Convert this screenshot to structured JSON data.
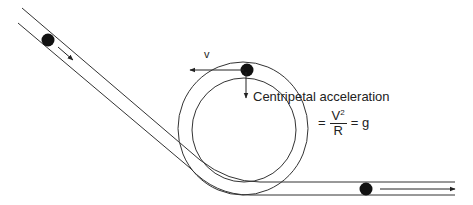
{
  "figure": {
    "labels": {
      "velocity": "v",
      "centripetal_caption": "Centripetal acceleration",
      "equation_equals_1": "=",
      "equation_numerator": "V",
      "equation_numerator_exponent": "2",
      "equation_denominator": "R",
      "equation_equals_2": "= g"
    },
    "colors": {
      "stroke": "#222222",
      "ball": "#111111",
      "background": "#ffffff"
    },
    "elements": [
      "inclined-track-entry",
      "ball-on-incline",
      "motion-arrow-incline",
      "loop-outer-rail",
      "loop-inner-rail",
      "ball-at-top-of-loop",
      "velocity-arrow",
      "centripetal-acceleration-arrow",
      "horizontal-track-exit",
      "ball-on-exit",
      "motion-arrow-exit"
    ]
  }
}
